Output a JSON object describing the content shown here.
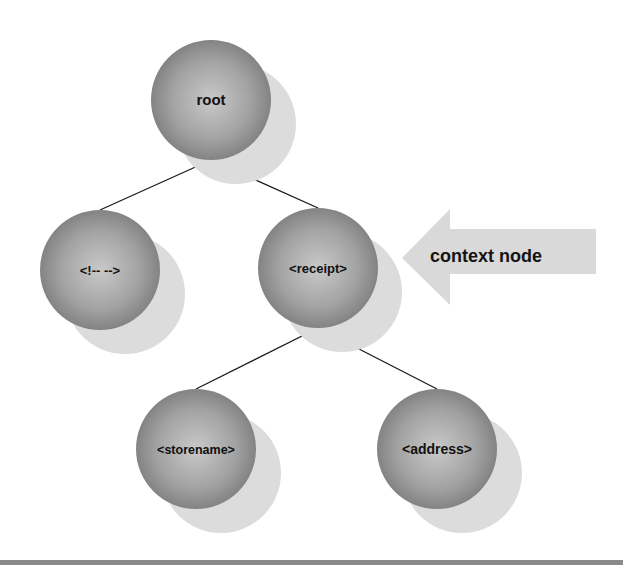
{
  "diagram": {
    "title": "",
    "colors": {
      "node_dark": "#7a7a7a",
      "node_light": "#c9c9c9",
      "shadow": "#dcdcdc",
      "edge": "#1a1a1a",
      "arrow": "#d9d9d9",
      "rule": "#8a8a8a"
    },
    "nodes": [
      {
        "id": "root",
        "label": "root",
        "cx": 211,
        "cy": 100,
        "font_size": 14
      },
      {
        "id": "comment",
        "label": "<!-- -->",
        "cx": 100,
        "cy": 270,
        "font_size": 13
      },
      {
        "id": "receipt",
        "label": "<receipt>",
        "cx": 318,
        "cy": 268,
        "font_size": 13
      },
      {
        "id": "storename",
        "label": "<storename>",
        "cx": 196,
        "cy": 449,
        "font_size": 13
      },
      {
        "id": "address",
        "label": "<address>",
        "cx": 437,
        "cy": 449,
        "font_size": 14
      }
    ],
    "edges": [
      {
        "from": "root",
        "to": "comment"
      },
      {
        "from": "root",
        "to": "receipt"
      },
      {
        "from": "receipt",
        "to": "storename"
      },
      {
        "from": "receipt",
        "to": "address"
      }
    ],
    "annotation": {
      "label": "context node",
      "points_to": "receipt",
      "icon": "left-arrow-icon"
    }
  }
}
